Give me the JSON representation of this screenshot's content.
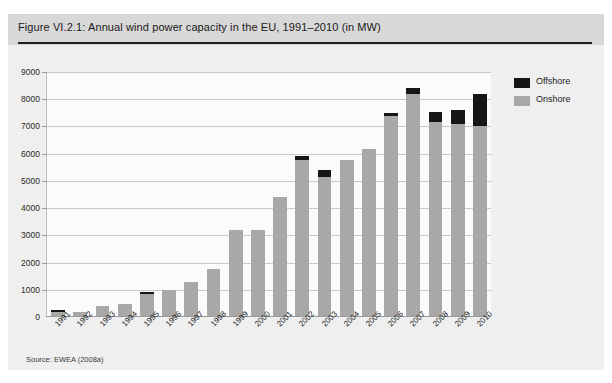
{
  "figure": {
    "title": "Figure VI.2.1: Annual wind power capacity in the EU, 1991–2010 (in MW)",
    "source": "Source: EWEA (2008a)"
  },
  "legend": {
    "position": "top-right",
    "items": [
      {
        "label": "Offshore",
        "color": "#161616"
      },
      {
        "label": "Onshore",
        "color": "#a8a8a8"
      }
    ]
  },
  "chart_data": {
    "type": "bar",
    "stacked": true,
    "title": "Figure VI.2.1: Annual wind power capacity in the EU, 1991–2010 (in MW)",
    "xlabel": "",
    "ylabel": "",
    "ylim": [
      0,
      9000
    ],
    "yticks": [
      0,
      1000,
      2000,
      3000,
      4000,
      5000,
      6000,
      7000,
      8000,
      9000
    ],
    "ytick_labels": [
      "0",
      "1000",
      "2000",
      "3000",
      "4000",
      "5000",
      "6000",
      "7000",
      "8000",
      "9000"
    ],
    "grid": true,
    "categories": [
      "1991",
      "1992",
      "1993",
      "1994",
      "1995",
      "1996",
      "1997",
      "1998",
      "1999",
      "2000",
      "2001",
      "2002",
      "2003",
      "2004",
      "2005",
      "2006",
      "2007",
      "2008",
      "2009",
      "2010"
    ],
    "series": [
      {
        "name": "Onshore",
        "color": "#a8a8a8",
        "values": [
          190,
          200,
          410,
          460,
          830,
          1010,
          1300,
          1750,
          3200,
          3200,
          4400,
          5750,
          5150,
          5780,
          6180,
          7400,
          8180,
          7150,
          7100,
          7000
        ]
      },
      {
        "name": "Offshore",
        "color": "#161616",
        "values": [
          60,
          0,
          0,
          0,
          70,
          0,
          0,
          0,
          0,
          0,
          0,
          150,
          250,
          0,
          0,
          100,
          230,
          400,
          500,
          1200
        ]
      }
    ],
    "totals": [
      250,
      200,
      410,
      460,
      900,
      1010,
      1300,
      1750,
      3200,
      3200,
      4400,
      5900,
      5400,
      5780,
      6180,
      7500,
      8410,
      7550,
      7600,
      8200
    ]
  }
}
